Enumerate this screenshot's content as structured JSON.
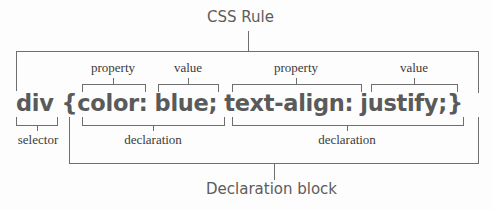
{
  "title": "CSS Rule",
  "code": {
    "selector": "div",
    "open_brace": "{",
    "decl1_property": "color:",
    "decl1_value": "blue;",
    "decl2_property": "text-align:",
    "decl2_value": "justify;",
    "close_brace": "}"
  },
  "labels": {
    "property_1": "property",
    "value_1": "value",
    "property_2": "property",
    "value_2": "value",
    "selector": "selector",
    "declaration_1": "declaration",
    "declaration_2": "declaration",
    "declaration_block": "Declaration block"
  },
  "colors": {
    "code_text": "#5a5a5a",
    "bracket_lines": "#6e6e6e",
    "label_text": "#3a3a3a"
  }
}
